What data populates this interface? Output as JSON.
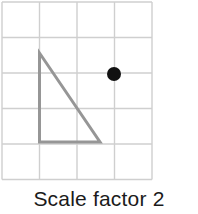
{
  "figure": {
    "caption": "Scale factor 2",
    "background_color": "#ffffff"
  },
  "chart_data": {
    "type": "scatter",
    "title": "Scale factor 2",
    "subtitle": "",
    "xlabel": "",
    "ylabel": "",
    "grid": {
      "visible": true,
      "columns": 4,
      "rows": 5,
      "cell_size_px": 37.5,
      "line_color": "#cfcfcf",
      "line_width_px": 1,
      "origin_px": {
        "x": 2,
        "y": 2
      },
      "x_tick_positions_px": [
        2,
        39.5,
        77,
        114.5,
        152
      ],
      "y_tick_positions_px": [
        2,
        37.5,
        73,
        108.5,
        144,
        179.5
      ]
    },
    "axis_units": {
      "xlim": [
        0,
        4
      ],
      "ylim": [
        0,
        5
      ]
    },
    "shapes": [
      {
        "name": "right-triangle",
        "type": "polygon",
        "closed": true,
        "stroke_color": "#969696",
        "stroke_width_px": 3,
        "fill": "none",
        "vertices_grid": [
          {
            "label": "apex",
            "x": 1,
            "y": 1.4
          },
          {
            "label": "bottom-left",
            "x": 1,
            "y": 3.9
          },
          {
            "label": "bottom-right",
            "x": 2.65,
            "y": 3.9
          }
        ],
        "vertices_px": [
          {
            "label": "apex",
            "x": 39.5,
            "y": 53
          },
          {
            "label": "bottom-left",
            "x": 39.5,
            "y": 142
          },
          {
            "label": "bottom-right",
            "x": 100,
            "y": 142
          }
        ]
      }
    ],
    "points": [
      {
        "name": "centre-of-enlargement",
        "label": "",
        "x": 3,
        "y": 2,
        "x_px": 114,
        "y_px": 74,
        "radius_px": 7,
        "color": "#111111",
        "marker": "filled-circle"
      }
    ],
    "series": [
      {
        "name": "centre-of-enlargement",
        "values": [
          {
            "x": 3,
            "y": 2
          }
        ]
      }
    ],
    "annotations": [
      {
        "name": "caption",
        "text": "Scale factor 2",
        "position": "below-grid",
        "color": "#1b1b1b"
      }
    ],
    "legend": {
      "visible": false,
      "position": "none",
      "entries": []
    },
    "colors": {
      "grid_line": "#cfcfcf",
      "shape_stroke": "#969696",
      "point_fill": "#111111",
      "caption_text": "#1b1b1b",
      "background": "#ffffff"
    }
  }
}
